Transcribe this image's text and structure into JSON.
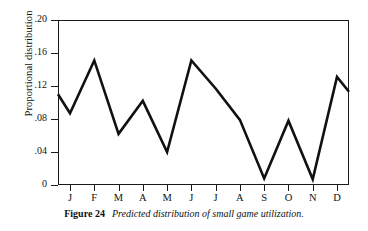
{
  "figure": {
    "caption_label": "Figure 24",
    "caption_text": "Predicted distribution of small game utilization."
  },
  "chart_data": {
    "type": "line",
    "title": "",
    "xlabel": "",
    "ylabel": "Proportional distribution",
    "categories": [
      "J",
      "F",
      "M",
      "A",
      "M",
      "J",
      "J",
      "A",
      "S",
      "O",
      "N",
      "D"
    ],
    "values": [
      0.087,
      0.151,
      0.062,
      0.102,
      0.04,
      0.151,
      0.117,
      0.079,
      0.008,
      0.078,
      0.007,
      0.131
    ],
    "edge_values": {
      "left_start": 0.11,
      "right_end": 0.113
    },
    "series": [
      {
        "name": "Predicted distribution of small game utilization",
        "values": [
          0.087,
          0.151,
          0.062,
          0.102,
          0.04,
          0.151,
          0.117,
          0.079,
          0.008,
          0.078,
          0.007,
          0.131
        ]
      }
    ],
    "ylim": [
      0,
      0.2
    ],
    "ytick_values": [
      0,
      0.04,
      0.08,
      0.12,
      0.16,
      0.2
    ],
    "ytick_labels": [
      "0",
      ".04",
      ".08",
      ".12",
      ".16",
      ".20"
    ],
    "grid": false,
    "legend": "none",
    "line_color": "#111111"
  }
}
